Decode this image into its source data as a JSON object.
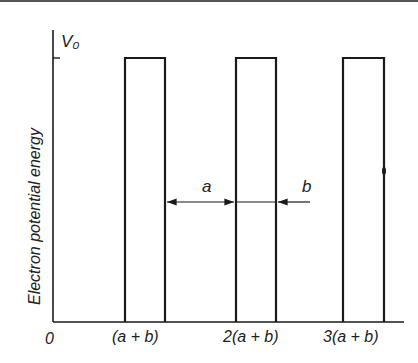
{
  "diagram": {
    "y_axis_label": "Electron potential energy",
    "y_level_label": "V₀",
    "x_tick_labels": [
      "0",
      "(a + b)",
      "2(a + b)",
      "3(a + b)"
    ],
    "dimension_labels": {
      "well_width": "a",
      "barrier_width": "b"
    },
    "colors": {
      "line": "#1a1a1a",
      "background": "#ffffff"
    }
  }
}
